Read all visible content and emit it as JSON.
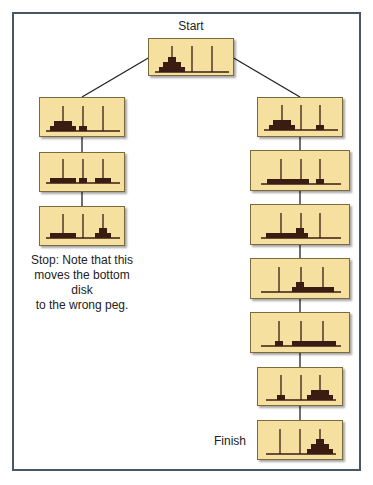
{
  "labels": {
    "start": "Start",
    "finish": "Finish",
    "stop_note": "Stop: Note that this moves the bottom disk to the wrong peg.",
    "stop_note_lines": [
      "Stop: Note that this",
      "moves the bottom disk",
      "to the wrong peg."
    ]
  },
  "colors": {
    "box_fill": "#f6e0a0",
    "box_border": "#7a6a3c",
    "disk": "#3b1c12",
    "peg": "#3b1c12",
    "frame": "#4a5566",
    "link": "#222222"
  },
  "states": [
    {
      "id": "start",
      "branch": "root",
      "pegs": {
        "A": [
          3,
          2,
          1
        ],
        "B": [],
        "C": []
      }
    },
    {
      "id": "left-1",
      "branch": "left",
      "pegs": {
        "A": [
          3,
          2
        ],
        "B": [
          1
        ],
        "C": []
      }
    },
    {
      "id": "left-2",
      "branch": "left",
      "pegs": {
        "A": [
          3
        ],
        "B": [
          1
        ],
        "C": [
          2
        ]
      }
    },
    {
      "id": "left-3",
      "branch": "left",
      "pegs": {
        "A": [
          3
        ],
        "B": [],
        "C": [
          2,
          1
        ]
      }
    },
    {
      "id": "right-1",
      "branch": "right",
      "pegs": {
        "A": [
          3,
          2
        ],
        "B": [],
        "C": [
          1
        ]
      }
    },
    {
      "id": "right-2",
      "branch": "right",
      "pegs": {
        "A": [
          3
        ],
        "B": [
          2
        ],
        "C": [
          1
        ]
      }
    },
    {
      "id": "right-3",
      "branch": "right",
      "pegs": {
        "A": [
          3
        ],
        "B": [
          2,
          1
        ],
        "C": []
      }
    },
    {
      "id": "right-4",
      "branch": "right",
      "pegs": {
        "A": [],
        "B": [
          3,
          1
        ],
        "C": []
      }
    },
    {
      "id": "right-5",
      "branch": "right",
      "pegs": {
        "A": [
          1
        ],
        "B": [],
        "C": [
          3
        ]
      }
    },
    {
      "id": "right-6",
      "branch": "right",
      "pegs": {
        "A": [
          1
        ],
        "B": [],
        "C": [
          3,
          2
        ]
      }
    },
    {
      "id": "finish",
      "branch": "right",
      "pegs": {
        "A": [],
        "B": [],
        "C": [
          3,
          2,
          1
        ]
      }
    }
  ]
}
